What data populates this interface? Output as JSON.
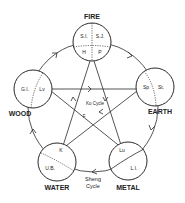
{
  "diagram": {
    "sheng_cycle_label_1": "Sheng",
    "sheng_cycle_label_2": "Cycle",
    "ko_cycle_label": "Ko Cycle",
    "elements": {
      "fire": {
        "name": "FIRE",
        "organs": [
          "S.I.",
          "S.J.",
          "H",
          "P"
        ]
      },
      "earth": {
        "name": "EARTH",
        "organs": [
          "Sp",
          "St."
        ]
      },
      "metal": {
        "name": "METAL",
        "organs": [
          "Lu",
          "L.I."
        ]
      },
      "water": {
        "name": "WATER",
        "organs": [
          "K",
          "U.B."
        ]
      },
      "wood": {
        "name": "WOOD",
        "organs": [
          "G.I.",
          "Lv"
        ]
      }
    },
    "ko_marker": "F",
    "colors": {
      "line": "#2a2a2a",
      "background": "#ffffff"
    }
  }
}
